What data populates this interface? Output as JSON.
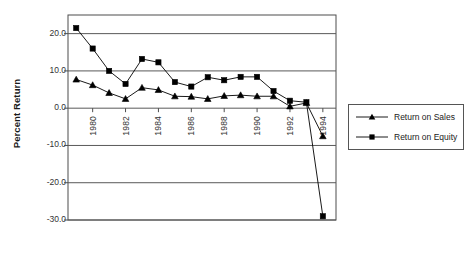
{
  "chart_data": {
    "type": "line",
    "title": "",
    "xlabel": "",
    "ylabel": "Percent Return",
    "x": [
      1979,
      1980,
      1981,
      1982,
      1983,
      1984,
      1985,
      1986,
      1987,
      1988,
      1989,
      1990,
      1991,
      1992,
      1993,
      1994
    ],
    "xticklabels": [
      "1980",
      "1982",
      "1984",
      "1986",
      "1988",
      "1990",
      "1992",
      "1994"
    ],
    "xtickvalues": [
      1980,
      1982,
      1984,
      1986,
      1988,
      1990,
      1992,
      1994
    ],
    "yticklabels": [
      "20.0",
      "10.0",
      "0.0",
      "-10.0",
      "-20.0",
      "-30.0"
    ],
    "ytickvalues": [
      20,
      10,
      0,
      -10,
      -20,
      -30
    ],
    "ylim": [
      -30,
      25
    ],
    "xlim": [
      1978.5,
      1994.8
    ],
    "grid": true,
    "grid_axis": "y",
    "legend_position": "right-outside",
    "series": [
      {
        "name": "Return on Sales",
        "marker": "triangle",
        "color": "#000000",
        "values": [
          7.7,
          6.2,
          4.1,
          2.5,
          5.5,
          4.9,
          3.2,
          3.1,
          2.5,
          3.3,
          3.5,
          3.2,
          3.2,
          0.5,
          1.4,
          -7.5
        ]
      },
      {
        "name": "Return on Equity",
        "marker": "square",
        "color": "#000000",
        "values": [
          21.5,
          16.0,
          10.0,
          6.5,
          13.2,
          12.3,
          7.0,
          5.8,
          8.3,
          7.5,
          8.4,
          8.4,
          4.6,
          2.0,
          1.6,
          -29.0
        ]
      }
    ]
  },
  "legend": {
    "items": [
      {
        "label": "Return on Sales",
        "marker": "triangle"
      },
      {
        "label": "Return on Equity",
        "marker": "square"
      }
    ]
  },
  "axis": {
    "y_title": "Percent Return"
  },
  "colors": {
    "axis": "#4d4d4d",
    "grid": "#595959",
    "series": "#000000",
    "text": "#1a1a1a",
    "background": "#ffffff"
  }
}
